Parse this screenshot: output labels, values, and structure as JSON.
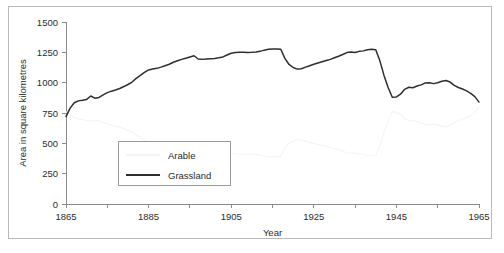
{
  "chart_data": {
    "type": "line",
    "title": "",
    "xlabel": "Year",
    "ylabel": "Area in square kilometres",
    "xlim": [
      1865,
      1965
    ],
    "ylim": [
      0,
      1500
    ],
    "grid": false,
    "legend_position": "inside-lower-left",
    "x_ticks": [
      1865,
      1875,
      1885,
      1895,
      1905,
      1915,
      1925,
      1935,
      1945,
      1955,
      1965
    ],
    "x_tick_labels": [
      "1865",
      "",
      "1885",
      "",
      "1905",
      "",
      "1925",
      "",
      "1945",
      "",
      "1965"
    ],
    "y_ticks": [
      0,
      250,
      500,
      750,
      1000,
      1250,
      1500
    ],
    "y_tick_labels": [
      "0",
      "250",
      "500",
      "750",
      "1000",
      "1250",
      "1500"
    ],
    "x": [
      1865,
      1866,
      1867,
      1868,
      1869,
      1870,
      1871,
      1872,
      1873,
      1874,
      1875,
      1876,
      1877,
      1878,
      1879,
      1880,
      1881,
      1882,
      1883,
      1884,
      1885,
      1886,
      1887,
      1888,
      1889,
      1890,
      1891,
      1892,
      1893,
      1894,
      1895,
      1896,
      1897,
      1898,
      1899,
      1900,
      1901,
      1902,
      1903,
      1904,
      1905,
      1906,
      1907,
      1908,
      1909,
      1910,
      1911,
      1912,
      1913,
      1914,
      1915,
      1916,
      1917,
      1918,
      1919,
      1920,
      1921,
      1922,
      1923,
      1924,
      1925,
      1926,
      1927,
      1928,
      1929,
      1930,
      1931,
      1932,
      1933,
      1934,
      1935,
      1936,
      1937,
      1938,
      1939,
      1940,
      1941,
      1942,
      1943,
      1944,
      1945,
      1946,
      1947,
      1948,
      1949,
      1950,
      1951,
      1952,
      1953,
      1954,
      1955,
      1956,
      1957,
      1958,
      1959,
      1960,
      1961,
      1962,
      1963,
      1964,
      1965
    ],
    "series": [
      {
        "name": "Grassland",
        "color": "#2e2e2e",
        "values": [
          720,
          790,
          835,
          850,
          855,
          862,
          890,
          872,
          878,
          900,
          918,
          930,
          940,
          952,
          968,
          985,
          1005,
          1035,
          1060,
          1085,
          1105,
          1112,
          1118,
          1128,
          1140,
          1152,
          1168,
          1180,
          1192,
          1202,
          1212,
          1222,
          1195,
          1192,
          1196,
          1198,
          1200,
          1205,
          1212,
          1228,
          1242,
          1248,
          1250,
          1250,
          1249,
          1250,
          1252,
          1258,
          1268,
          1275,
          1278,
          1278,
          1275,
          1200,
          1150,
          1125,
          1112,
          1115,
          1128,
          1140,
          1152,
          1162,
          1172,
          1182,
          1192,
          1205,
          1218,
          1232,
          1248,
          1252,
          1248,
          1258,
          1262,
          1272,
          1275,
          1272,
          1180,
          1060,
          960,
          880,
          882,
          905,
          945,
          962,
          958,
          972,
          982,
          998,
          1000,
          992,
          1000,
          1012,
          1018,
          1005,
          978,
          960,
          948,
          932,
          912,
          885,
          840
        ]
      },
      {
        "name": "Arable",
        "color": "#f4f4f4",
        "values": [
          760,
          735,
          712,
          700,
          695,
          690,
          682,
          690,
          685,
          672,
          660,
          650,
          642,
          632,
          620,
          608,
          592,
          568,
          548,
          528,
          512,
          508,
          505,
          498,
          490,
          482,
          470,
          462,
          455,
          448,
          442,
          435,
          455,
          458,
          455,
          452,
          450,
          446,
          440,
          428,
          418,
          412,
          410,
          410,
          412,
          410,
          408,
          402,
          395,
          390,
          388,
          388,
          392,
          460,
          500,
          520,
          532,
          528,
          518,
          508,
          498,
          490,
          482,
          475,
          468,
          458,
          448,
          436,
          422,
          418,
          422,
          412,
          408,
          400,
          396,
          400,
          480,
          590,
          685,
          760,
          758,
          738,
          702,
          688,
          690,
          678,
          668,
          655,
          652,
          660,
          652,
          642,
          636,
          648,
          672,
          688,
          698,
          712,
          730,
          755,
          800
        ]
      }
    ]
  },
  "legend": {
    "items": [
      {
        "label": "Arable"
      },
      {
        "label": "Grassland"
      }
    ]
  },
  "axes": {
    "x_title": "Year",
    "y_title": "Area in square kilometres"
  }
}
